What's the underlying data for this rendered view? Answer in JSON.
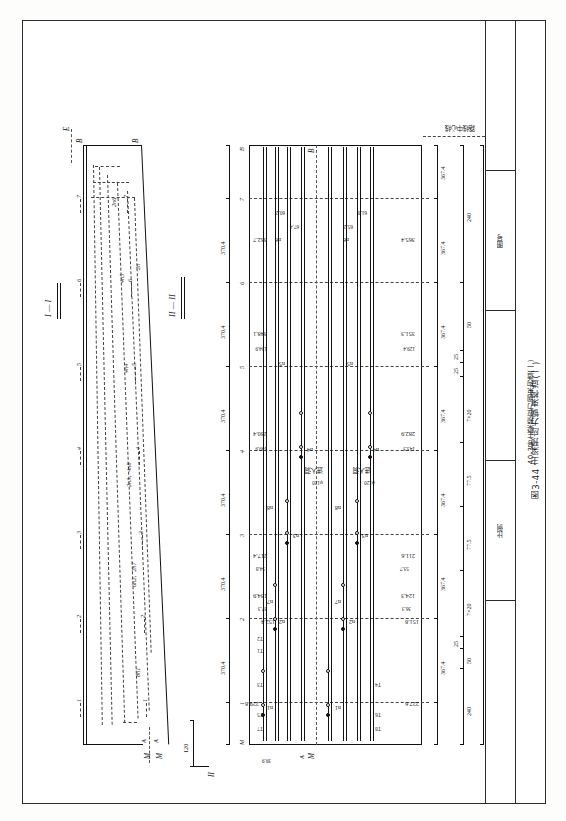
{
  "drawing": {
    "title_block": {
      "sheet_title": "40-3号主梁预应力钢束构造(一)",
      "figure_caption": "图3-44  主梁预应力钢束构造(一)",
      "fields": [
        {
          "label": "图号"
        },
        {
          "label": "比例"
        }
      ]
    },
    "section_views": {
      "label_top": "I — I",
      "label_bottom": "II — II",
      "tendon_groups": [
        "2n6",
        "4n5",
        "2n",
        "4n4",
        "2n3、4n8",
        "6n2、2n7",
        "8n1"
      ],
      "end_marks": [
        "B",
        "B",
        "A",
        "A",
        "M",
        "M"
      ],
      "rib_numbers": [
        "1",
        "2",
        "3",
        "4",
        "5",
        "6",
        "7"
      ],
      "left_dim": "120",
      "end_dim": "39.9"
    },
    "elevation": {
      "station_marks": [
        "1",
        "2",
        "3",
        "4",
        "5",
        "6",
        "7"
      ],
      "end_marks": {
        "left": "M",
        "right": "B"
      },
      "spacing_top": [
        "370.4",
        "370.4",
        "370.4",
        "370.4",
        "370.4",
        "370.4",
        "370.4"
      ],
      "spacing_bottom": [
        "367.4",
        "367.4",
        "367.4",
        "367.4",
        "367.4",
        "367.4",
        "367.4",
        "367.4"
      ],
      "tendon_labels_upper": [
        "n1",
        "n2",
        "n3",
        "n4",
        "n5",
        "n6",
        "n7",
        "n8"
      ],
      "tendon_labels_lower": [
        "n1",
        "n2",
        "n3",
        "n4",
        "n5",
        "n6",
        "n7",
        "n8"
      ],
      "anchor_labels": [
        "T7",
        "T5",
        "T3",
        "T1",
        "T2",
        "T4",
        "T6",
        "T8"
      ],
      "note_access_hole": "进人洞",
      "note_duct": "φ120",
      "centerline_note": "路线中心线",
      "dimensions_upper": [
        "229.8",
        "152.4",
        "37.3",
        "134.9",
        "54.8",
        "217.4",
        "149.9",
        "280.4",
        "134.9",
        "348.1",
        "362.7"
      ],
      "dimensions_lower": [
        "227.6",
        "151.8",
        "36.3",
        "124.3",
        "53.7",
        "211.6",
        "143.3",
        "282.9",
        "129.4",
        "351.3",
        "365.4"
      ],
      "dimensions_tendon_ends": [
        "60.2",
        "67.4",
        "61.8",
        "65.2"
      ],
      "bottom_chain": [
        "240",
        "50",
        "25",
        "7×20",
        "77.5",
        "77.5",
        "7×20",
        "25",
        "25",
        "50",
        "240"
      ],
      "bottom_total": "1 600"
    },
    "colors": {
      "ink": "#111111",
      "paper": "#ffffff",
      "frame": "#2a2a2a"
    }
  }
}
